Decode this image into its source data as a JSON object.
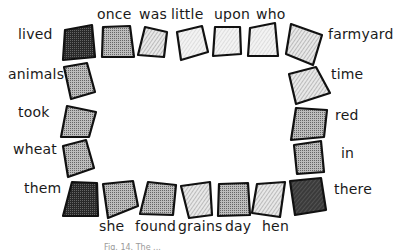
{
  "diagram": {
    "type": "word-game-board",
    "words": {
      "top": [
        "once",
        "was",
        "little",
        "upon",
        "who"
      ],
      "left": [
        "lived",
        "animals",
        "took",
        "wheat",
        "them"
      ],
      "right": [
        "farmyard",
        "time",
        "red",
        "in",
        "there"
      ],
      "bottom": [
        "she",
        "found",
        "grains",
        "day",
        "hen"
      ]
    },
    "caption": "Fig. 14. The ..."
  }
}
